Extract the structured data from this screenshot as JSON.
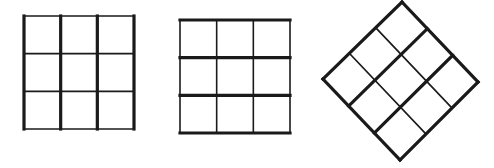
{
  "figure": {
    "stroke_color": "#1a1a1a",
    "background": "#ffffff",
    "grids": [
      {
        "id": "grid-vertical-emphasis",
        "label": "3x3 grid with thick vertical lines",
        "rows": 3,
        "cols": 3,
        "thick_direction": "vertical",
        "x": 24,
        "y": 16,
        "w": 110,
        "h": 113,
        "rotation": 0,
        "thick_width": 3.2,
        "thin_width": 1.6
      },
      {
        "id": "grid-horizontal-emphasis",
        "label": "3x3 grid with thick horizontal lines",
        "rows": 3,
        "cols": 3,
        "thick_direction": "horizontal",
        "x": 180,
        "y": 20,
        "w": 110,
        "h": 113,
        "rotation": 0,
        "thick_width": 3.2,
        "thin_width": 1.6
      },
      {
        "id": "grid-diagonal-emphasis",
        "label": "3x3 grid rotated 45 degrees with thick diagonal lines",
        "rows": 3,
        "cols": 3,
        "thick_direction": "diagonal",
        "corners": {
          "top": [
            402,
            2
          ],
          "right": [
            478,
            82
          ],
          "bottom": [
            400,
            160
          ],
          "left": [
            323,
            79
          ]
        },
        "rotation": 45,
        "thick_width": 3.2,
        "thin_width": 1.6
      }
    ]
  }
}
